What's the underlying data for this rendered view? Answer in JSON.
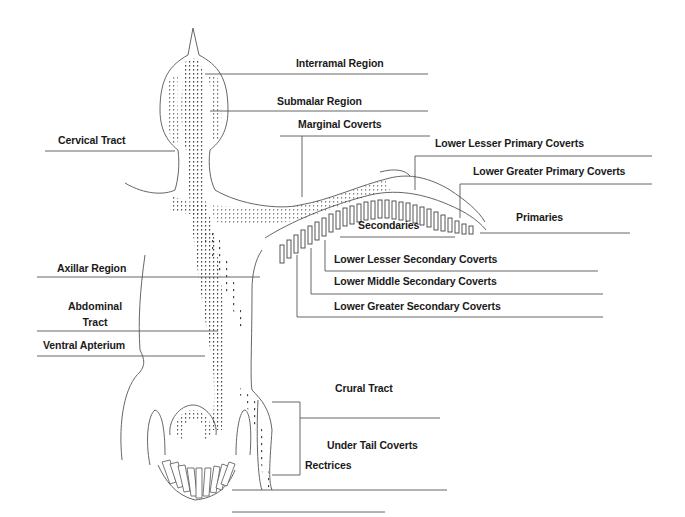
{
  "diagram": {
    "labels": {
      "interramal_region": "Interramal Region",
      "submalar_region": "Submalar Region",
      "marginal_coverts": "Marginal Coverts",
      "cervical_tract": "Cervical Tract",
      "lower_lesser_primary_coverts": "Lower Lesser Primary Coverts",
      "lower_greater_primary_coverts": "Lower Greater Primary Coverts",
      "primaries": "Primaries",
      "secondaries": "Secondaries",
      "lower_lesser_secondary_coverts": "Lower Lesser Secondary Coverts",
      "lower_middle_secondary_coverts": "Lower Middle Secondary Coverts",
      "lower_greater_secondary_coverts": "Lower Greater Secondary Coverts",
      "axillar_region": "Axillar Region",
      "abdominal_tract_line1": "Abdominal",
      "abdominal_tract_line2": "Tract",
      "ventral_apterium": "Ventral Apterium",
      "crural_tract": "Crural Tract",
      "under_tail_coverts": "Under Tail Coverts",
      "rectrices": "Rectrices"
    },
    "colors": {
      "line": "#555555",
      "text": "#1a1a1a",
      "stipple": "#333333"
    }
  }
}
